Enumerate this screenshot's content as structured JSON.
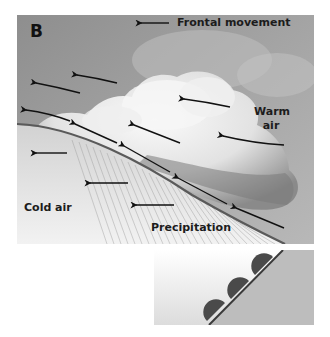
{
  "figure": {
    "panel_letter": "B",
    "labels": {
      "frontal_movement": "Frontal movement",
      "warm_air_line1": "Warm",
      "warm_air_line2": "air",
      "cold_air": "Cold air",
      "precipitation": "Precipitation"
    },
    "icons": {
      "direction_arrows": "left-pointing arrows indicating air movement",
      "front_symbol": "warm-front semicircles on line"
    },
    "colors": {
      "sky": "#9a9a9a",
      "cloud": "#ececec",
      "cloud_shadow": "#6e6e6e",
      "cold_air": "#e2e2e2",
      "front_line": "#5a5a5a",
      "arrow": "#111111",
      "inset_warm_side": "#bdbdbd",
      "front_marker": "#4a4a4a"
    }
  }
}
